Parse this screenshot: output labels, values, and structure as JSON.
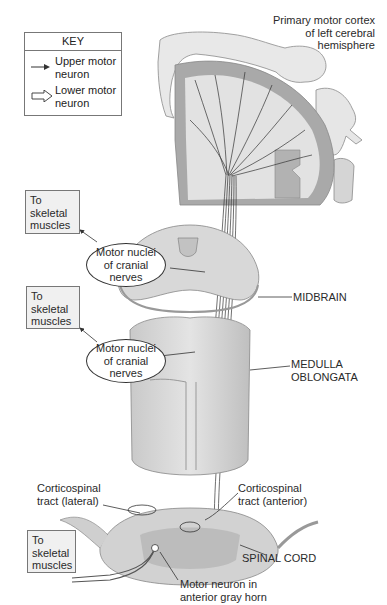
{
  "key": {
    "title": "KEY",
    "items": [
      {
        "icon": "thin-arrow-icon",
        "label_line1": "Upper motor",
        "label_line2": "neuron"
      },
      {
        "icon": "hollow-arrow-icon",
        "label_line1": "Lower motor",
        "label_line2": "neuron"
      }
    ]
  },
  "labels": {
    "cortex": {
      "line1": "Primary motor cortex",
      "line2": "of left cerebral",
      "line3": "hemisphere"
    },
    "midbrain": "MIDBRAIN",
    "medulla": {
      "line1": "MEDULLA",
      "line2": "OBLONGATA"
    },
    "ct_lateral": {
      "line1": "Corticospinal",
      "line2": "tract (lateral)"
    },
    "ct_anterior": {
      "line1": "Corticospinal",
      "line2": "tract (anterior)"
    },
    "spinal_cord": "SPINAL CORD",
    "motor_neuron": {
      "line1": "Motor neuron in",
      "line2": "anterior gray horn"
    }
  },
  "targets": [
    {
      "line1": "To",
      "line2": "skeletal",
      "line3": "muscles"
    },
    {
      "line1": "To",
      "line2": "skeletal",
      "line3": "muscles"
    },
    {
      "line1": "To",
      "line2": "skeletal",
      "line3": "muscles"
    }
  ],
  "nuclei": [
    {
      "line1": "Motor nuclei",
      "line2": "of cranial",
      "line3": "nerves"
    },
    {
      "line1": "Motor nuclei",
      "line2": "of cranial",
      "line3": "nerves"
    }
  ],
  "colors": {
    "cortex_gray": "#a9a9a9",
    "white_matter": "#e2e2e2",
    "tissue_light": "#d6d6d6",
    "tissue_mid": "#bdbdbd",
    "line": "#333333"
  }
}
